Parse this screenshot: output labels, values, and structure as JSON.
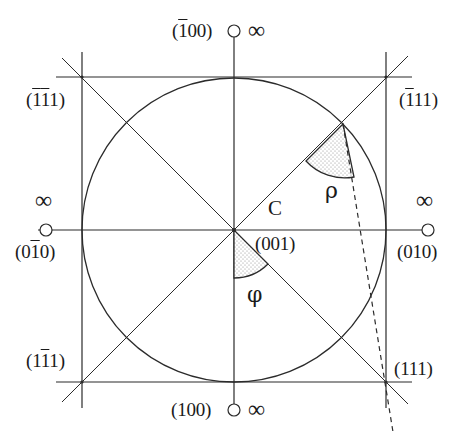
{
  "figure": {
    "center_label": "C",
    "infinity_symbol": "∞",
    "angles": {
      "phi": "φ",
      "rho": "ρ"
    },
    "poles": {
      "top": {
        "prefix": "(",
        "bar": "1",
        "rest": "00)",
        "full": "(1̄00)",
        "at_infinity": true
      },
      "bottom": {
        "full": "(100)",
        "at_infinity": true
      },
      "left": {
        "prefix": "(0",
        "bar": "1",
        "rest": "0)",
        "full": "(01̄0)",
        "at_infinity": true
      },
      "right": {
        "full": "(010)",
        "at_infinity": true
      },
      "center": {
        "full": "(001)"
      }
    },
    "corners": {
      "top_left": {
        "prefix": "(",
        "bar1": "1",
        "bar2": "1",
        "rest": "1)",
        "full": "(1̄1̄1)"
      },
      "top_right": {
        "prefix": "(",
        "bar": "1",
        "rest": "11)",
        "full": "(1̄11)"
      },
      "bottom_left": {
        "prefix": "(1",
        "bar": "1",
        "rest": "1)",
        "full": "(11̄1)"
      },
      "bottom_right": {
        "full": "(111)"
      }
    }
  },
  "colors": {
    "line": "#2b2b2b",
    "text": "#1a1a1a",
    "background": "#ffffff",
    "stipple": "#8a8a8a"
  }
}
